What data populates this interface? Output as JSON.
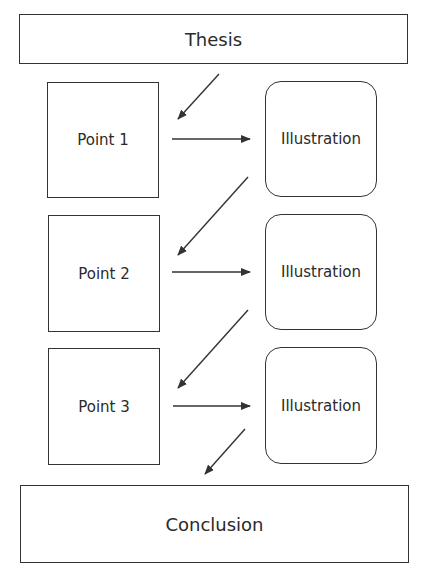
{
  "diagram": {
    "type": "flowchart",
    "nodes": {
      "thesis": {
        "label": "Thesis"
      },
      "points": [
        {
          "label": "Point 1"
        },
        {
          "label": "Point 2"
        },
        {
          "label": "Point 3"
        }
      ],
      "illustrations": [
        {
          "label": "Illustration"
        },
        {
          "label": "Illustration"
        },
        {
          "label": "Illustration"
        }
      ],
      "conclusion": {
        "label": "Conclusion"
      }
    },
    "edges": [
      {
        "from": "Thesis",
        "to": "Point 1"
      },
      {
        "from": "Point 1",
        "to": "Illustration 1"
      },
      {
        "from": "Illustration 1",
        "to": "Point 2"
      },
      {
        "from": "Point 2",
        "to": "Illustration 2"
      },
      {
        "from": "Illustration 2",
        "to": "Point 3"
      },
      {
        "from": "Point 3",
        "to": "Illustration 3"
      },
      {
        "from": "Illustration 3",
        "to": "Conclusion"
      }
    ],
    "colors": {
      "stroke": "#333333",
      "background": "#ffffff",
      "text": "#2a2a2a"
    }
  }
}
